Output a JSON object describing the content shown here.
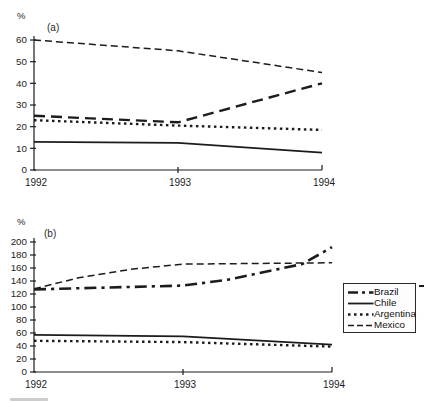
{
  "figure": {
    "background": "#ffffff",
    "line_color": "#1c1c1c"
  },
  "legend": {
    "position": "right-middle",
    "items": [
      {
        "label": "Brazil",
        "dash": "dashdot-bold"
      },
      {
        "label": "Chile",
        "dash": "solid"
      },
      {
        "label": "Argentina",
        "dash": "dot"
      },
      {
        "label": "Mexico",
        "dash": "dash"
      }
    ]
  },
  "chart_data": [
    {
      "type": "line",
      "panel": "(a)",
      "ylabel": "%",
      "xlabel": "",
      "grid": false,
      "ylim": [
        0,
        60
      ],
      "y_ticks": [
        0,
        10,
        20,
        30,
        40,
        50,
        60
      ],
      "x_ticks": [
        1992,
        1993,
        1994
      ],
      "x_tick_labels": [
        "1992",
        "1993",
        "1994"
      ],
      "series": [
        {
          "name": "Brazil",
          "dash": "longdash-bold",
          "x": [
            1992,
            1993,
            1994
          ],
          "values": [
            25,
            22,
            40
          ]
        },
        {
          "name": "Chile",
          "dash": "solid",
          "x": [
            1992,
            1993,
            1994
          ],
          "values": [
            13,
            12.5,
            8
          ]
        },
        {
          "name": "Argentina",
          "dash": "dot",
          "x": [
            1992,
            1993,
            1994
          ],
          "values": [
            23,
            20.5,
            18.5
          ]
        },
        {
          "name": "Mexico",
          "dash": "dash",
          "x": [
            1992,
            1993,
            1994
          ],
          "values": [
            60,
            55,
            45
          ]
        }
      ]
    },
    {
      "type": "line",
      "panel": "(b)",
      "ylabel": "%",
      "xlabel": "",
      "grid": false,
      "ylim": [
        0,
        200
      ],
      "y_ticks": [
        0,
        20,
        40,
        60,
        80,
        100,
        120,
        140,
        160,
        180,
        200
      ],
      "x_ticks": [
        1992,
        1993,
        1994
      ],
      "x_tick_labels": [
        "1992",
        "1993",
        "1994"
      ],
      "series": [
        {
          "name": "Brazil",
          "dash": "dashdot-bold",
          "x": [
            1992,
            1993,
            1993.3,
            1993.8,
            1994
          ],
          "values": [
            127,
            133,
            142,
            166,
            192
          ]
        },
        {
          "name": "Chile",
          "dash": "solid",
          "x": [
            1992,
            1993,
            1994
          ],
          "values": [
            57,
            55,
            42
          ]
        },
        {
          "name": "Argentina",
          "dash": "dot",
          "x": [
            1992,
            1993,
            1994
          ],
          "values": [
            48,
            46,
            39
          ]
        },
        {
          "name": "Mexico",
          "dash": "dash",
          "x": [
            1992,
            1992.3,
            1992.65,
            1993,
            1994
          ],
          "values": [
            128,
            145,
            158,
            166,
            168
          ]
        }
      ]
    }
  ]
}
